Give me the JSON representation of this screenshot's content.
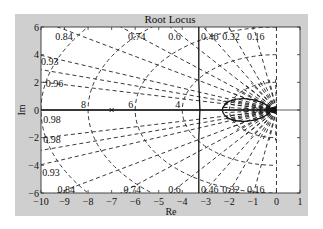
{
  "chart_data": {
    "type": "line",
    "title": "Root Locus",
    "xlabel": "Re",
    "ylabel": "Im",
    "xlim": [
      -10,
      1
    ],
    "ylim": [
      -6,
      6
    ],
    "x_ticks": [
      "-10",
      "-9",
      "-8",
      "-7",
      "-6",
      "-5",
      "-4",
      "-3",
      "-2",
      "-1",
      "0",
      "1"
    ],
    "y_ticks": [
      "6",
      "4",
      "2",
      "0",
      "-2",
      "-4",
      "-6"
    ],
    "grid": "sgrid",
    "damping_labels_top": [
      "0.84",
      "0.74",
      "0.6",
      "0.46",
      "0.32",
      "0.16",
      "0.93",
      "0.96",
      "0.98"
    ],
    "damping_labels_bottom": [
      "0.98",
      "0.93",
      "0.84",
      "0.74",
      "0.6",
      "0.46",
      "0.32",
      "0.16"
    ],
    "damping_ratios": [
      0.16,
      0.32,
      0.46,
      0.6,
      0.74,
      0.84,
      0.93,
      0.96,
      0.98
    ],
    "natural_frequency_labels": [
      "8",
      "6",
      "4",
      "2"
    ],
    "natural_frequencies": [
      2,
      4,
      6,
      8,
      10
    ],
    "poles": [
      {
        "re": -7,
        "im": 0
      }
    ],
    "locus_branches": [
      {
        "name": "vertical branch",
        "points": [
          [
            -3.3,
            6
          ],
          [
            -3.3,
            2
          ],
          [
            -3.25,
            0
          ],
          [
            -3.3,
            -2
          ],
          [
            -3.3,
            -6
          ]
        ]
      },
      {
        "name": "real-axis branch",
        "points": [
          [
            -10,
            0
          ],
          [
            0,
            0
          ]
        ]
      }
    ]
  }
}
